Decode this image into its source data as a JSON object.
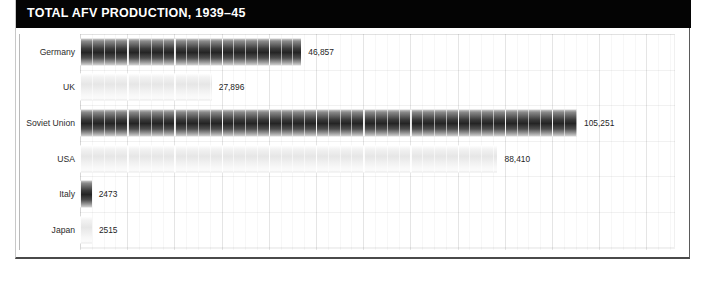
{
  "header": {
    "title": "TOTAL AFV PRODUCTION, 1939–45",
    "background_color": "#040404",
    "text_color": "#ffffff"
  },
  "chart_data": {
    "type": "bar",
    "orientation": "horizontal",
    "title": "TOTAL AFV PRODUCTION, 1939–45",
    "xlabel": "",
    "ylabel": "",
    "grid": true,
    "legend": "none",
    "xlim": [
      0,
      126000
    ],
    "categories": [
      "Germany",
      "UK",
      "Soviet Union",
      "USA",
      "Italy",
      "Japan"
    ],
    "values": [
      46857,
      27896,
      105251,
      88410,
      2473,
      2515
    ],
    "value_labels": [
      "46,857",
      "27,896",
      "105,251",
      "88,410",
      "2473",
      "2515"
    ],
    "bar_styles": [
      "dark",
      "light",
      "dark",
      "light",
      "dark",
      "light"
    ]
  },
  "colors": {
    "bar_dark_core": "#242424",
    "bar_light_core": "#e6e6e6",
    "gridline": "#ebebeb",
    "frame": "#4a4a4a",
    "label_text": "#2b2b2b"
  }
}
